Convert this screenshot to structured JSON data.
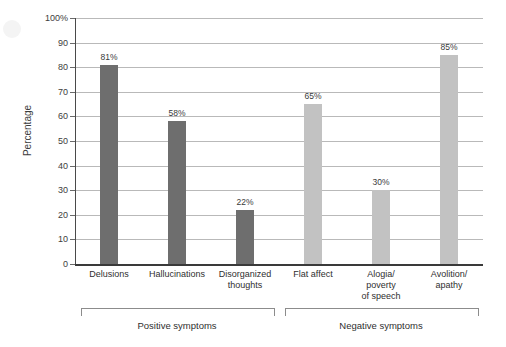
{
  "chart_data": {
    "type": "bar",
    "title": "",
    "xlabel": "",
    "ylabel": "Percentage",
    "ylim": [
      0,
      100
    ],
    "grid": true,
    "legend": "none",
    "categories": [
      "Delusions",
      "Disorganized thoughts",
      "Hallucinations",
      "Flat affect",
      "Alogia/ poverty of speech",
      "Avolition/ apathy"
    ],
    "values": [
      81,
      58,
      22,
      65,
      30,
      85
    ],
    "value_labels": [
      "81%",
      "58%",
      "22%",
      "65%",
      "30%",
      "85%"
    ],
    "ytick_labels": [
      "100%",
      "90",
      "80",
      "70",
      "60",
      "50",
      "40",
      "30",
      "20",
      "10",
      "0"
    ],
    "ytick_values": [
      100,
      90,
      80,
      70,
      60,
      50,
      40,
      30,
      20,
      10,
      0
    ],
    "bars": [
      {
        "label_lines": [
          "Delusions"
        ],
        "value": 81,
        "value_label": "81%",
        "group": "positive",
        "color": "#6e6e6e"
      },
      {
        "label_lines": [
          "Hallucinations"
        ],
        "value": 58,
        "value_label": "58%",
        "group": "positive",
        "color": "#6e6e6e"
      },
      {
        "label_lines": [
          "Disorganized",
          "thoughts"
        ],
        "value": 22,
        "value_label": "22%",
        "group": "positive",
        "color": "#6e6e6e"
      },
      {
        "label_lines": [
          "Flat affect"
        ],
        "value": 65,
        "value_label": "65%",
        "group": "negative",
        "color": "#c2c2c2"
      },
      {
        "label_lines": [
          "Alogia/",
          "poverty",
          "of speech"
        ],
        "value": 30,
        "value_label": "30%",
        "group": "negative",
        "color": "#c2c2c2"
      },
      {
        "label_lines": [
          "Avolition/",
          "apathy"
        ],
        "value": 85,
        "value_label": "85%",
        "group": "negative",
        "color": "#c2c2c2"
      }
    ],
    "groups": [
      {
        "key": "positive",
        "label": "Positive symptoms",
        "color": "#6e6e6e"
      },
      {
        "key": "negative",
        "label": "Negative symptoms",
        "color": "#c2c2c2"
      }
    ],
    "colors": {
      "positive_bar": "#6e6e6e",
      "negative_bar": "#c2c2c2",
      "gridline": "#b9b9b9",
      "axis": "#3a3a3a",
      "text": "#2f2f2f",
      "background": "#ffffff"
    }
  }
}
